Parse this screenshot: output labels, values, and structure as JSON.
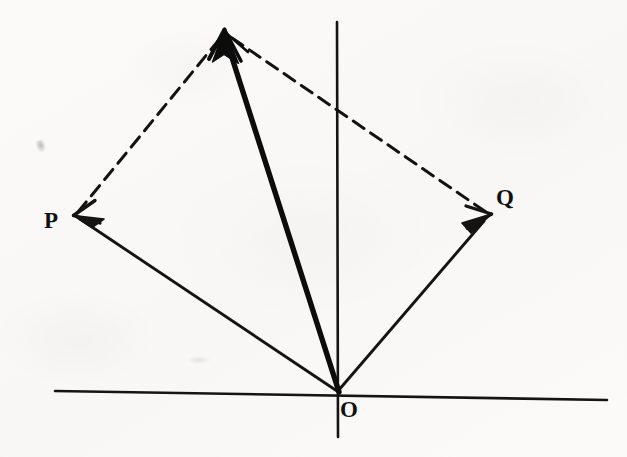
{
  "figure": {
    "background_color": "#fbfaf8",
    "ink_color": "#101010",
    "width": 627,
    "height": 457
  },
  "labels": {
    "origin": "O",
    "vector_p": "P",
    "vector_q": "Q"
  },
  "geometry": {
    "origin": {
      "x": 338,
      "y": 392
    },
    "axes": {
      "horizontal": {
        "x1": 55,
        "y1": 391,
        "x2": 607,
        "y2": 400
      },
      "vertical": {
        "x1": 337,
        "y1": 22,
        "x2": 338,
        "y2": 437
      }
    },
    "vectors": [
      {
        "name": "P",
        "style": "solid",
        "stroke_width": 2.6,
        "from": {
          "x": 338,
          "y": 392
        },
        "to": {
          "x": 74,
          "y": 216
        },
        "arrowhead": "open-barbed"
      },
      {
        "name": "Q",
        "style": "solid",
        "stroke_width": 2.6,
        "from": {
          "x": 338,
          "y": 392
        },
        "to": {
          "x": 490,
          "y": 215
        },
        "arrowhead": "open-barbed"
      },
      {
        "name": "R",
        "style": "solid-bold",
        "stroke_width": 5.2,
        "from": {
          "x": 338,
          "y": 392
        },
        "to": {
          "x": 225,
          "y": 31
        },
        "arrowhead": "solid-filled"
      }
    ],
    "construction_lines": [
      {
        "name": "P-to-resultant",
        "style": "dashed",
        "stroke_width": 3.0,
        "dash": "13 8",
        "from": {
          "x": 78,
          "y": 212
        },
        "to": {
          "x": 222,
          "y": 36
        }
      },
      {
        "name": "resultant-to-Q",
        "style": "dashed",
        "stroke_width": 3.0,
        "dash": "13 8",
        "from": {
          "x": 232,
          "y": 38
        },
        "to": {
          "x": 486,
          "y": 212
        }
      }
    ]
  },
  "chart_data": {
    "type": "scatter",
    "xlabel": "",
    "ylabel": "",
    "points": [
      {
        "label": "O",
        "x": 0,
        "y": 0
      },
      {
        "label": "P",
        "x": -264,
        "y": 176
      },
      {
        "label": "Q",
        "x": 152,
        "y": 177
      },
      {
        "label": "R",
        "x": -113,
        "y": 361
      }
    ],
    "annotations": [
      "Vector P drawn from origin O up and to the left",
      "Vector Q drawn from origin O up and to the right",
      "Bold resultant vector R = P + Q drawn from O to the far apex",
      "Dashed lines complete the parallelogram O-P-R-Q"
    ],
    "grid": false,
    "legend": "none"
  }
}
